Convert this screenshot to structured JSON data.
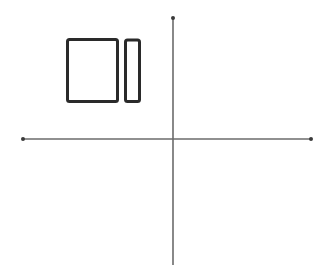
{
  "canvas": {
    "width": 330,
    "height": 265,
    "background": "#ffffff"
  },
  "colors": {
    "axis": "#6b6b6b",
    "axis_endpoint": "#3a3a3a",
    "rect_stroke": "#2a2a2a"
  },
  "axes": {
    "vertical": {
      "x": 173,
      "y1": 18,
      "y2": 265,
      "endpoint_top": true
    },
    "horizontal": {
      "y": 139,
      "x1": 23,
      "x2": 311,
      "endpoint_left": true,
      "endpoint_right": true
    }
  },
  "shapes": [
    {
      "id": "large-rectangle",
      "x": 67.5,
      "y": 39.5,
      "width": 50,
      "height": 62,
      "rx": 2
    },
    {
      "id": "narrow-rectangle",
      "x": 125.5,
      "y": 40,
      "width": 14,
      "height": 61.5,
      "rx": 2
    }
  ]
}
